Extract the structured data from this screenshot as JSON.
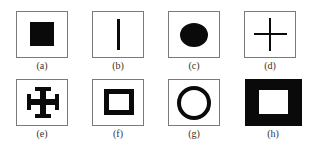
{
  "figure": {
    "panels": [
      {
        "id": "a",
        "label": "(a)",
        "shape": "filled-square"
      },
      {
        "id": "b",
        "label": "(b)",
        "shape": "vertical-line"
      },
      {
        "id": "c",
        "label": "(c)",
        "shape": "filled-ellipse"
      },
      {
        "id": "d",
        "label": "(d)",
        "shape": "plus-cross"
      },
      {
        "id": "e",
        "label": "(e)",
        "shape": "cross-potent"
      },
      {
        "id": "f",
        "label": "(f)",
        "shape": "square-frame"
      },
      {
        "id": "g",
        "label": "(g)",
        "shape": "ring"
      },
      {
        "id": "h",
        "label": "(h)",
        "shape": "thick-square-frame"
      }
    ],
    "colors": {
      "shape": "#0a0a0a",
      "border": "#7a7a7a",
      "background": "#ffffff"
    }
  }
}
